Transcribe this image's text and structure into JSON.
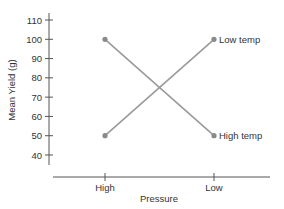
{
  "chart_data": {
    "type": "line",
    "title": "",
    "xlabel": "Pressure",
    "ylabel": "Mean Yield (g)",
    "categories": [
      "High",
      "Low"
    ],
    "series": [
      {
        "name": "Low temp",
        "values": [
          50,
          100
        ]
      },
      {
        "name": "High temp",
        "values": [
          100,
          50
        ]
      }
    ],
    "ylim": [
      35,
      112
    ],
    "yticks": [
      40,
      50,
      60,
      70,
      80,
      90,
      100,
      110
    ],
    "grid": false,
    "legend_position": "inline-right",
    "colors": {
      "line": "#9a9a9a",
      "marker": "#8a8a8a",
      "axis": "#555555",
      "text": "#333333"
    }
  }
}
